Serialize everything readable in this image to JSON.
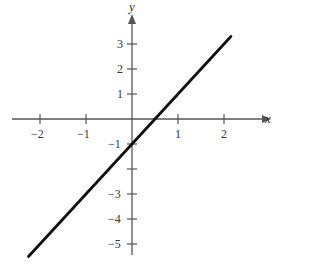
{
  "chart_data": {
    "type": "line",
    "title": "",
    "xlabel": "x",
    "ylabel": "y",
    "xlim": [
      -2.3,
      2.9
    ],
    "ylim": [
      -5.5,
      3.7
    ],
    "grid": false,
    "x_ticks": [
      -2,
      -1,
      1,
      2
    ],
    "y_ticks": [
      3,
      2,
      1,
      -1,
      -2,
      -3,
      -4,
      -5
    ],
    "x_tick_labels": [
      "−2",
      "−1",
      "1",
      "2"
    ],
    "y_tick_labels": [
      "3",
      "2",
      "1",
      "−1",
      "",
      "−3",
      "−4",
      "−5"
    ],
    "series": [
      {
        "name": "y = 2x − 1",
        "x": [
          -2.25,
          2.15
        ],
        "y": [
          -5.5,
          3.3
        ],
        "color": "#111111"
      }
    ]
  }
}
